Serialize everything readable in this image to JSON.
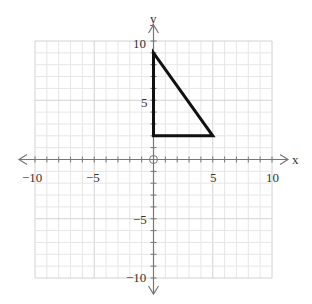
{
  "chart_data": {
    "type": "line",
    "title": "",
    "xlabel": "x",
    "ylabel": "y",
    "xlim": [
      -10,
      10
    ],
    "ylim": [
      -10,
      10
    ],
    "grid": true,
    "minor_grid_step": 1,
    "major_grid_step": 5,
    "x_tick_labels": [
      "-10",
      "-5",
      "5",
      "10"
    ],
    "y_tick_labels": [
      "10",
      "5",
      "-5",
      "-10"
    ],
    "shapes": [
      {
        "name": "triangle",
        "kind": "polygon",
        "vertices": [
          [
            0,
            9
          ],
          [
            0,
            2
          ],
          [
            5,
            2
          ]
        ],
        "stroke": "#111111",
        "stroke_width": 3
      }
    ]
  },
  "labels": {
    "x_axis": "x",
    "y_axis": "y",
    "x_neg10": "−10",
    "x_neg5": "−5",
    "x_5": "5",
    "x_10": "10",
    "y_10": "10",
    "y_5": "5",
    "y_neg5": "−5",
    "y_neg10": "−10"
  },
  "colors": {
    "grid_minor": "#e6e6e6",
    "grid_major": "#d2d2d2",
    "axis": "#777777",
    "shape": "#111111"
  }
}
